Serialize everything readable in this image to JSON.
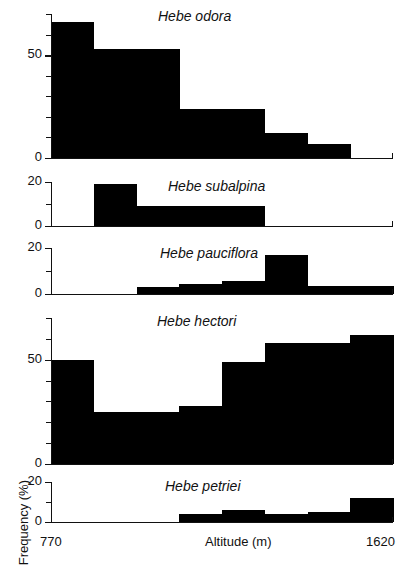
{
  "figure": {
    "ylabel": "Frequency (%)",
    "xlabel": "Altitude (m)",
    "x_start_label": "770",
    "x_end_label": "1620",
    "axis_color": "#111111",
    "bar_color": "#000000",
    "background": "#ffffff"
  },
  "chart_data": {
    "type": "bar",
    "title": "",
    "xlabel": "Altitude (m)",
    "ylabel": "Frequency (%)",
    "xlim": [
      770,
      1620
    ],
    "grid": false,
    "legend": "none",
    "bin_edges": [
      770,
      876,
      982,
      1088,
      1194,
      1300,
      1406,
      1513,
      1620
    ],
    "categories": [
      "770-876",
      "876-982",
      "982-1088",
      "1088-1194",
      "1194-1300",
      "1300-1406",
      "1406-1513",
      "1513-1620"
    ],
    "panels": [
      {
        "name": "Hebe odora",
        "ylim": [
          0,
          70
        ],
        "yticks": [
          0,
          50
        ],
        "yticklabels": [
          "0",
          "50"
        ],
        "yminorticks": [
          10,
          20,
          30,
          40,
          60,
          70
        ],
        "values": [
          66,
          53,
          53,
          24,
          24,
          12,
          7,
          0
        ]
      },
      {
        "name": "Hebe subalpina",
        "ylim": [
          0,
          20
        ],
        "yticks": [
          0,
          20
        ],
        "yticklabels": [
          "0",
          "20"
        ],
        "yminorticks": [
          10
        ],
        "values": [
          0,
          19,
          9,
          9,
          9,
          0,
          0,
          0
        ]
      },
      {
        "name": "Hebe pauciflora",
        "ylim": [
          0,
          20
        ],
        "yticks": [
          0,
          20
        ],
        "yticklabels": [
          "0",
          "20"
        ],
        "yminorticks": [
          10
        ],
        "values": [
          0,
          0,
          3,
          4.5,
          5.5,
          17,
          3.5,
          3.5
        ]
      },
      {
        "name": "Hebe hectori",
        "ylim": [
          0,
          70
        ],
        "yticks": [
          0,
          50
        ],
        "yticklabels": [
          "0",
          "50"
        ],
        "yminorticks": [
          10,
          20,
          30,
          40,
          60,
          70
        ],
        "values": [
          50,
          25,
          25,
          28,
          49,
          58,
          58,
          62,
          55
        ]
      },
      {
        "name": "Hebe petriei",
        "ylim": [
          0,
          20
        ],
        "yticks": [
          0,
          20
        ],
        "yticklabels": [
          "0",
          "20"
        ],
        "yminorticks": [
          10
        ],
        "values": [
          0,
          0,
          0,
          4,
          6,
          4,
          5,
          12
        ]
      }
    ]
  }
}
